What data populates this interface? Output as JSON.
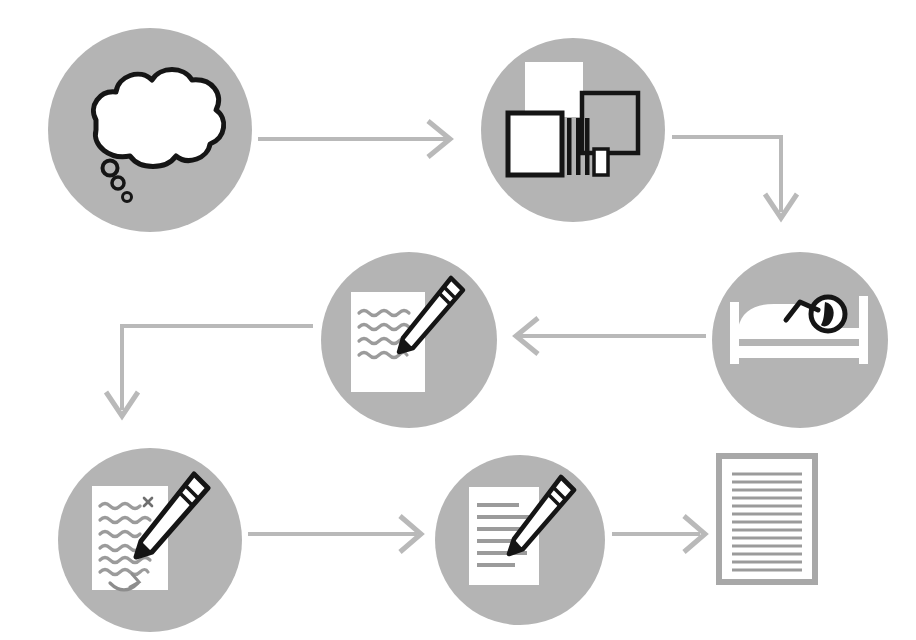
{
  "diagram": {
    "canvas": {
      "width": 916,
      "height": 640
    },
    "palette": {
      "background": "#ffffff",
      "circle_fill": "#b4b4b4",
      "arrow": "#b9b9b9",
      "icon_outline": "#1a1a1a",
      "icon_paper": "#ffffff",
      "text_line": "#9b9b9b",
      "document_border": "#a8a8a8"
    },
    "flow_order": [
      "thought-bubble",
      "books-research",
      "sleep-incubation",
      "handwritten-draft",
      "revision-edit",
      "typed-draft",
      "final-document"
    ],
    "nodes": [
      {
        "id": "thought-bubble",
        "step": 1,
        "icon_name": "thought-bubble-icon",
        "label": "Thought bubble with three trailing dots",
        "has_circle": true,
        "cx": 150,
        "cy": 130,
        "r": 102
      },
      {
        "id": "books-research",
        "step": 2,
        "icon_name": "books-research-icon",
        "label": "Stack of books and papers",
        "has_circle": true,
        "cx": 573,
        "cy": 130,
        "r": 92
      },
      {
        "id": "sleep-incubation",
        "step": 3,
        "icon_name": "person-sleeping-in-bed-icon",
        "label": "Person sleeping in bed",
        "has_circle": true,
        "cx": 800,
        "cy": 340,
        "r": 88
      },
      {
        "id": "handwritten-draft",
        "step": 4,
        "icon_name": "handwritten-draft-pencil-icon",
        "label": "Paper with wavy handwriting and pencil",
        "has_circle": true,
        "cx": 409,
        "cy": 340,
        "r": 88
      },
      {
        "id": "revision-edit",
        "step": 5,
        "icon_name": "revision-edit-pencil-icon",
        "label": "Draft being edited with strikeout and move arrow",
        "has_circle": true,
        "cx": 150,
        "cy": 540,
        "r": 92
      },
      {
        "id": "typed-draft",
        "step": 6,
        "icon_name": "typed-draft-pencil-icon",
        "label": "Typed page with straight lines and pencil",
        "has_circle": true,
        "cx": 520,
        "cy": 540,
        "r": 85
      },
      {
        "id": "final-document",
        "step": 7,
        "icon_name": "final-document-icon",
        "label": "Finished bordered document of text lines",
        "has_circle": false,
        "cx": 765,
        "cy": 540,
        "r": 0
      }
    ],
    "connectors": [
      {
        "id": "c1",
        "from": "thought-bubble",
        "to": "books-research",
        "shape": "straight-right",
        "direction": "right"
      },
      {
        "id": "c2",
        "from": "books-research",
        "to": "sleep-incubation",
        "shape": "elbow-right-down",
        "direction": "down"
      },
      {
        "id": "c3",
        "from": "sleep-incubation",
        "to": "handwritten-draft",
        "shape": "straight-left",
        "direction": "left"
      },
      {
        "id": "c4",
        "from": "handwritten-draft",
        "to": "revision-edit",
        "shape": "elbow-left-down",
        "direction": "down"
      },
      {
        "id": "c5",
        "from": "revision-edit",
        "to": "typed-draft",
        "shape": "straight-right",
        "direction": "right"
      },
      {
        "id": "c6",
        "from": "typed-draft",
        "to": "final-document",
        "shape": "straight-right",
        "direction": "right"
      }
    ],
    "icon_details": {
      "thought_bubble_dots": 3,
      "books_rectangles": 4,
      "book_spines": 3,
      "handwritten_wavy_lines": 4,
      "revision_wavy_lines": 6,
      "typed_draft_lines": 6,
      "final_document_lines": 14
    }
  }
}
